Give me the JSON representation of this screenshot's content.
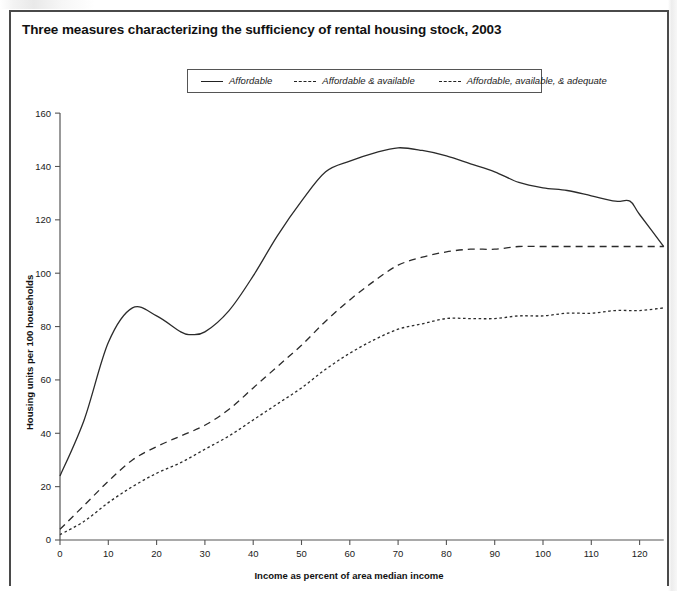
{
  "figure": {
    "title": "Three measures characterizing the sufficiency of rental housing stock, 2003"
  },
  "legend": {
    "entries": [
      {
        "label": "Affordable",
        "style": "solid"
      },
      {
        "label": "Affordable & available",
        "style": "dashed"
      },
      {
        "label": "Affordable, available, & adequate",
        "style": "dotted"
      }
    ]
  },
  "chart_data": {
    "type": "line",
    "title": "Three measures characterizing the sufficiency of rental housing stock, 2003",
    "xlabel": "Income as percent of area median income",
    "ylabel": "Housing units per 100 households",
    "xlim": [
      0,
      125
    ],
    "ylim": [
      0,
      160
    ],
    "xticks": [
      0,
      10,
      20,
      30,
      40,
      50,
      60,
      70,
      80,
      90,
      100,
      110,
      120
    ],
    "yticks": [
      0,
      20,
      40,
      60,
      80,
      100,
      120,
      140,
      160
    ],
    "grid": false,
    "legend_position": "top-center",
    "series": [
      {
        "name": "Affordable",
        "style": "solid",
        "x": [
          0,
          5,
          10,
          15,
          20,
          25,
          27,
          30,
          35,
          40,
          45,
          50,
          55,
          60,
          65,
          70,
          75,
          80,
          85,
          90,
          95,
          100,
          105,
          110,
          115,
          118,
          120,
          125
        ],
        "values": [
          24,
          45,
          74,
          87,
          84,
          78,
          77,
          78,
          86,
          99,
          114,
          127,
          138,
          142,
          145,
          147,
          146,
          144,
          141,
          138,
          134,
          132,
          131,
          129,
          127,
          127,
          122,
          110
        ]
      },
      {
        "name": "Affordable & available",
        "style": "dashed",
        "x": [
          0,
          5,
          10,
          15,
          20,
          25,
          30,
          35,
          40,
          45,
          50,
          55,
          60,
          65,
          70,
          75,
          80,
          85,
          90,
          95,
          100,
          105,
          110,
          115,
          120,
          125
        ],
        "values": [
          4,
          13,
          22,
          30,
          35,
          39,
          43,
          49,
          57,
          65,
          73,
          82,
          90,
          97,
          103,
          106,
          108,
          109,
          109,
          110,
          110,
          110,
          110,
          110,
          110,
          110
        ]
      },
      {
        "name": "Affordable, available, & adequate",
        "style": "dotted",
        "x": [
          0,
          5,
          10,
          15,
          20,
          25,
          30,
          35,
          40,
          45,
          50,
          55,
          60,
          65,
          70,
          75,
          80,
          85,
          90,
          95,
          100,
          105,
          110,
          115,
          120,
          125
        ],
        "values": [
          2,
          7,
          14,
          20,
          25,
          29,
          34,
          39,
          45,
          51,
          57,
          64,
          70,
          75,
          79,
          81,
          83,
          83,
          83,
          84,
          84,
          85,
          85,
          86,
          86,
          87
        ]
      }
    ]
  }
}
